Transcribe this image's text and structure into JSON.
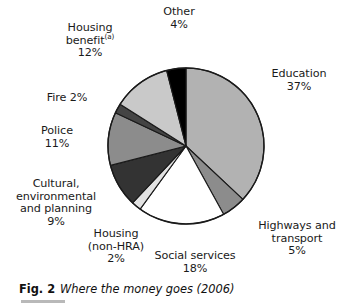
{
  "figure": {
    "number": "Fig. 2",
    "caption": "Where the money goes (2006)"
  },
  "chart_data": {
    "type": "pie",
    "title": "Where the money goes (2006)",
    "xlabel": "",
    "ylabel": "",
    "legend_position": "none",
    "labels_placement": "outside-callout",
    "grid": false,
    "start_angle_deg": 0,
    "direction": "clockwise",
    "units": "percent",
    "total": 100,
    "categories": [
      "Education",
      "Highways and transport",
      "Social services",
      "Housing (non-HRA)",
      "Cultural, environmental and planning",
      "Police",
      "Fire",
      "Housing benefit",
      "Other"
    ],
    "values": [
      37,
      5,
      18,
      2,
      9,
      11,
      2,
      12,
      4
    ],
    "colors": [
      "#b2b2b2",
      "#8c8c8c",
      "#ffffff",
      "#e2e2e2",
      "#333333",
      "#8c8c8c",
      "#444444",
      "#c9c9c9",
      "#000000"
    ],
    "slices": [
      {
        "name": "Education",
        "value": 37,
        "display_value": "37%",
        "color": "#b2b2b2"
      },
      {
        "name": "Highways and transport",
        "value": 5,
        "display_value": "5%",
        "color": "#8c8c8c"
      },
      {
        "name": "Social services",
        "value": 18,
        "display_value": "18%",
        "color": "#ffffff"
      },
      {
        "name": "Housing (non-HRA)",
        "value": 2,
        "display_value": "2%",
        "color": "#e2e2e2"
      },
      {
        "name": "Cultural, environmental and planning",
        "value": 9,
        "display_value": "9%",
        "color": "#333333"
      },
      {
        "name": "Police",
        "value": 11,
        "display_value": "11%",
        "color": "#8c8c8c"
      },
      {
        "name": "Fire",
        "value": 2,
        "display_value": "2%",
        "color": "#444444"
      },
      {
        "name": "Housing benefit",
        "value": 12,
        "display_value": "12%",
        "color": "#c9c9c9"
      },
      {
        "name": "Other",
        "value": 4,
        "display_value": "4%",
        "color": "#000000"
      }
    ]
  },
  "labels": {
    "other": {
      "name": "Other",
      "percent": "4%"
    },
    "housing_benefit": {
      "name": "Housing",
      "name2": "benefit",
      "footnote": "(a)",
      "percent": "12%"
    },
    "education": {
      "name": "Education",
      "percent": "37%"
    },
    "fire": {
      "name": "Fire 2%"
    },
    "police": {
      "name": "Police",
      "percent": "11%"
    },
    "cultural": {
      "line1": "Cultural,",
      "line2": "environmental",
      "line3": "and planning",
      "percent": "9%"
    },
    "housing_nonhra": {
      "line1": "Housing",
      "line2": "(non-HRA)",
      "percent": "2%"
    },
    "social_services": {
      "name": "Social services",
      "percent": "18%"
    },
    "highways": {
      "line1": "Highways and",
      "line2": "transport",
      "percent": "5%"
    }
  }
}
